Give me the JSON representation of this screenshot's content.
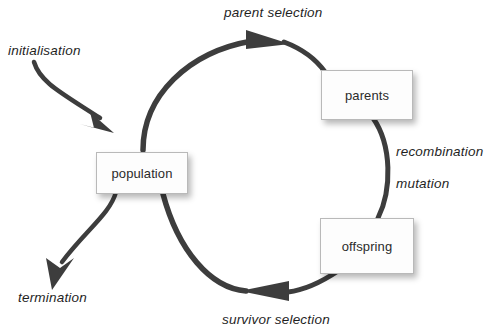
{
  "diagram": {
    "stroke_color": "#3d3d3d",
    "box_fill": "#fdfdfd",
    "box_border": "#b9b9b9",
    "text_color": "#1f1f1f",
    "nodes": [
      {
        "id": "population",
        "label": "population"
      },
      {
        "id": "parents",
        "label": "parents"
      },
      {
        "id": "offspring",
        "label": "offspring"
      }
    ],
    "edge_labels": [
      {
        "id": "parent-selection",
        "label": "parent selection"
      },
      {
        "id": "initialisation",
        "label": "initialisation"
      },
      {
        "id": "recombination",
        "label": "recombination"
      },
      {
        "id": "mutation",
        "label": "mutation"
      },
      {
        "id": "termination",
        "label": "termination"
      },
      {
        "id": "survivor-selection",
        "label": "survivor selection"
      }
    ]
  }
}
